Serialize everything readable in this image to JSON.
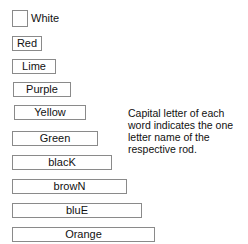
{
  "rods": [
    {
      "label": "White",
      "length_units": 1
    },
    {
      "label": "Red",
      "length_units": 2
    },
    {
      "label": "Lime",
      "length_units": 3
    },
    {
      "label": "Purple",
      "length_units": 4
    },
    {
      "label": "Yellow",
      "length_units": 5
    },
    {
      "label": "Green",
      "length_units": 6
    },
    {
      "label": "blacK",
      "length_units": 7
    },
    {
      "label": "browN",
      "length_units": 8
    },
    {
      "label": "bluE",
      "length_units": 9
    },
    {
      "label": "Orange",
      "length_units": 10
    }
  ],
  "note": "Capital letter of each word indicates the one letter name of the respective rod.",
  "colors": {
    "border": "#8a8a8a",
    "text": "#111111",
    "background": "#ffffff"
  }
}
